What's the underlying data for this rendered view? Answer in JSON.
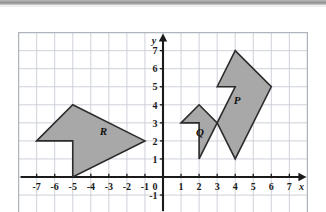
{
  "figure": {
    "type": "coordinate-plane-diagram",
    "background_color": "#ffffff",
    "grid_color": "#c9cdd6",
    "axis_color": "#1a1a1a",
    "shape_fill": "#a8a8a8",
    "shape_stroke": "#2b2b2b"
  },
  "axes": {
    "x_label": "x",
    "y_label": "y",
    "x_min": -8,
    "x_max": 8,
    "y_min": -2,
    "y_max": 8,
    "x_ticks": [
      {
        "value": -7,
        "label": "-7"
      },
      {
        "value": -6,
        "label": "-6"
      },
      {
        "value": -5,
        "label": "-5"
      },
      {
        "value": -4,
        "label": "-4"
      },
      {
        "value": -3,
        "label": "-3"
      },
      {
        "value": -2,
        "label": "-2"
      },
      {
        "value": -1,
        "label": "-1"
      },
      {
        "value": 1,
        "label": "1"
      },
      {
        "value": 2,
        "label": "2"
      },
      {
        "value": 3,
        "label": "3"
      },
      {
        "value": 4,
        "label": "4"
      },
      {
        "value": 5,
        "label": "5"
      },
      {
        "value": 6,
        "label": "6"
      },
      {
        "value": 7,
        "label": "7"
      }
    ],
    "y_ticks": [
      {
        "value": 7,
        "label": "7"
      },
      {
        "value": 6,
        "label": "6"
      },
      {
        "value": 5,
        "label": "5"
      },
      {
        "value": 4,
        "label": "4"
      },
      {
        "value": 3,
        "label": "3"
      },
      {
        "value": 2,
        "label": "2"
      },
      {
        "value": 1,
        "label": "1"
      },
      {
        "value": -1,
        "label": "-1"
      }
    ],
    "origin_label": "0"
  },
  "shapes": [
    {
      "id": "R",
      "label": "R",
      "label_position": {
        "x": -3.3,
        "y": 2.35
      },
      "vertices": [
        {
          "x": -7,
          "y": 2
        },
        {
          "x": -5,
          "y": 4
        },
        {
          "x": -1,
          "y": 2
        },
        {
          "x": -5,
          "y": 0
        },
        {
          "x": -5,
          "y": 2
        }
      ]
    },
    {
      "id": "P",
      "label": "P",
      "label_position": {
        "x": 4.1,
        "y": 4.05
      },
      "vertices": [
        {
          "x": 3,
          "y": 5
        },
        {
          "x": 4,
          "y": 7
        },
        {
          "x": 6,
          "y": 5
        },
        {
          "x": 4,
          "y": 1
        },
        {
          "x": 3,
          "y": 3
        },
        {
          "x": 4,
          "y": 5
        }
      ]
    },
    {
      "id": "Q",
      "label": "Q",
      "label_position": {
        "x": 2.05,
        "y": 2.25
      },
      "vertices": [
        {
          "x": 1,
          "y": 3
        },
        {
          "x": 2,
          "y": 4
        },
        {
          "x": 3,
          "y": 3
        },
        {
          "x": 2,
          "y": 1
        },
        {
          "x": 2,
          "y": 3
        }
      ]
    }
  ]
}
